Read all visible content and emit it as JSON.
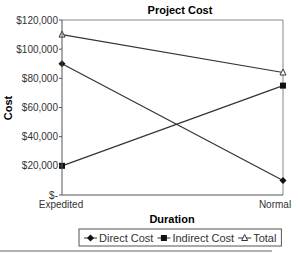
{
  "chart_data": {
    "type": "line",
    "title": "Project Cost",
    "xlabel": "Duration",
    "ylabel": "Cost",
    "categories": [
      "Expedited",
      "Normal"
    ],
    "series": [
      {
        "name": "Direct Cost",
        "marker": "diamond",
        "values": [
          90000,
          10000
        ]
      },
      {
        "name": "Indirect Cost",
        "marker": "square",
        "values": [
          20000,
          75000
        ]
      },
      {
        "name": "Total",
        "marker": "triangle-open",
        "values": [
          110000,
          84000
        ]
      }
    ],
    "ylim": [
      0,
      120000
    ],
    "yticks": [
      0,
      20000,
      40000,
      60000,
      80000,
      100000,
      120000
    ],
    "ytick_labels": [
      "$-",
      "$20,000",
      "$40,000",
      "$60,000",
      "$80,000",
      "$100,000",
      "$120,000"
    ],
    "grid": false,
    "legend_position": "bottom"
  }
}
